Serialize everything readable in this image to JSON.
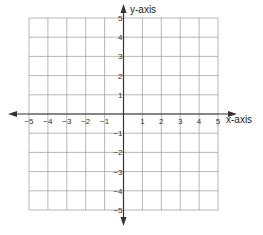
{
  "chart_data": {
    "type": "scatter",
    "title": "",
    "xlabel": "x-axis",
    "ylabel": "y-axis",
    "xlim": [
      -5,
      5
    ],
    "ylim": [
      -5,
      5
    ],
    "grid": true,
    "x_ticks": [
      "−5",
      "−4",
      "−3",
      "−2",
      "−1",
      "1",
      "2",
      "3",
      "4",
      "5"
    ],
    "y_ticks": [
      "5",
      "4",
      "3",
      "2",
      "1",
      "−1",
      "−2",
      "−3",
      "−4",
      "−5"
    ],
    "points": []
  },
  "colors": {
    "grid": "#9a9a9a",
    "axis": "#333333",
    "text": "#333333"
  }
}
